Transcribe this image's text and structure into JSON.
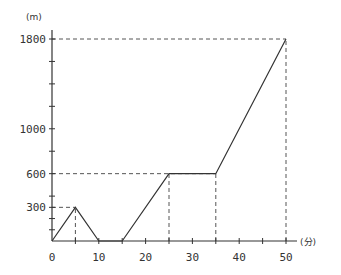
{
  "chart_data": {
    "type": "line",
    "title": "",
    "xlabel": "(分)",
    "ylabel": "(m)",
    "xlim": [
      0,
      50
    ],
    "ylim": [
      0,
      1800
    ],
    "grid": false,
    "x_ticks": [
      0,
      10,
      20,
      30,
      40,
      50
    ],
    "x_minor_ticks": [
      5,
      15,
      25,
      35,
      45
    ],
    "y_ticks_labeled": [
      300,
      600,
      1000,
      1800
    ],
    "y_minor_ticks": [
      100,
      200,
      400,
      800,
      1200,
      1400,
      1600
    ],
    "series": [
      {
        "name": "distance",
        "points": [
          [
            0,
            0
          ],
          [
            5,
            300
          ],
          [
            10,
            0
          ],
          [
            15,
            0
          ],
          [
            25,
            600
          ],
          [
            35,
            600
          ],
          [
            50,
            1800
          ]
        ]
      }
    ],
    "reference_lines": [
      {
        "type": "h",
        "y": 300,
        "x_to": 5
      },
      {
        "type": "v",
        "x": 5,
        "y_to": 300
      },
      {
        "type": "h",
        "y": 600,
        "x_to": 35
      },
      {
        "type": "v",
        "x": 25,
        "y_to": 600
      },
      {
        "type": "v",
        "x": 35,
        "y_to": 600
      },
      {
        "type": "h",
        "y": 1800,
        "x_to": 50
      },
      {
        "type": "v",
        "x": 50,
        "y_to": 1800
      }
    ]
  },
  "labels": {
    "y_unit": "(m)",
    "x_unit": "(分)"
  },
  "style": {
    "line_color": "#333333",
    "dash_color": "#555555"
  }
}
